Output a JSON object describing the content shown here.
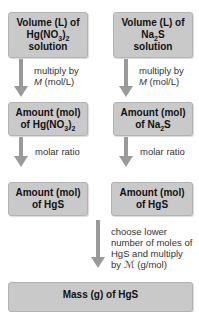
{
  "left": {
    "box1": {
      "line1": "Volume (L) of",
      "line2a": "Hg(NO",
      "line2sub": "3",
      "line2b": ")",
      "line2sub2": "2",
      "line3": "solution"
    },
    "step1": {
      "line1": "multiply by",
      "line2a": "M",
      "line2b": " (mol/L)"
    },
    "box2": {
      "line1": "Amount (mol)",
      "line2a": "of Hg(NO",
      "line2sub": "3",
      "line2b": ")",
      "line2sub2": "2"
    },
    "step2": {
      "line1": "molar ratio"
    },
    "box3": {
      "line1": "Amount (mol)",
      "line2": "of HgS"
    }
  },
  "right": {
    "box1": {
      "line1": "Volume (L) of",
      "line2a": "Na",
      "line2sub": "2",
      "line2b": "S",
      "line3": "solution"
    },
    "step1": {
      "line1": "multiply by",
      "line2a": "M",
      "line2b": " (mol/L)"
    },
    "box2": {
      "line1": "Amount (mol)",
      "line2a": "of Na",
      "line2sub": "2",
      "line2b": "S"
    },
    "step2": {
      "line1": "molar ratio"
    },
    "box3": {
      "line1": "Amount (mol)",
      "line2": "of HgS"
    }
  },
  "final_step": {
    "line1": "choose lower",
    "line2": "number of moles of",
    "line3": "HgS and multiply",
    "line4": "by ℳ (g/mol)"
  },
  "final_box": {
    "line1": "Mass (g) of HgS"
  },
  "colors": {
    "box_fill": "#c9c9c9",
    "arrow": "#9a9a9a"
  }
}
